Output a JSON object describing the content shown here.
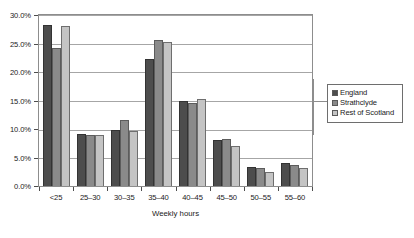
{
  "chart_data": {
    "type": "bar",
    "title": "",
    "xlabel": "Weekly hours",
    "ylabel": "",
    "categories": [
      "<25",
      "25–30",
      "30–35",
      "35–40",
      "40–45",
      "45–50",
      "50–55",
      "55–60"
    ],
    "ylim": [
      0,
      30
    ],
    "ytick_labels": [
      "0.0%",
      "5.0%",
      "10.0%",
      "15.0%",
      "20.0%",
      "25.0%",
      "30.0%"
    ],
    "ytick_values": [
      0,
      5,
      10,
      15,
      20,
      25,
      30
    ],
    "grid": true,
    "legend_position": "right",
    "series": [
      {
        "name": "England",
        "color": "#4d4d4d",
        "values": [
          28.2,
          9.2,
          9.9,
          22.3,
          14.9,
          8.1,
          3.4,
          4.0
        ]
      },
      {
        "name": "Strathclyde",
        "color": "#8a8a8a",
        "values": [
          24.2,
          9.0,
          11.6,
          25.7,
          14.5,
          8.3,
          3.1,
          3.6
        ]
      },
      {
        "name": "Rest of Scotland",
        "color": "#c4c4c4",
        "values": [
          28.0,
          9.0,
          9.7,
          25.2,
          15.2,
          7.1,
          2.4,
          3.1
        ]
      }
    ]
  }
}
